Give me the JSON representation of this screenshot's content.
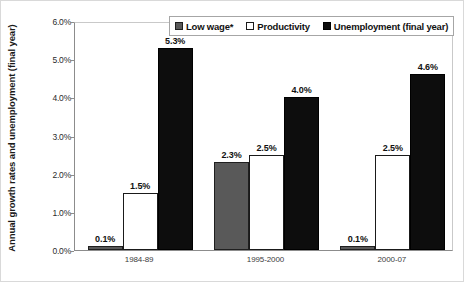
{
  "chart_data": {
    "type": "bar",
    "title": "",
    "xlabel": "",
    "ylabel": "Annual growth rates and unemployment (final year)",
    "ylim": [
      0,
      6
    ],
    "ytick_labels": [
      "6.0%",
      "5.0%",
      "4.0%",
      "3.0%",
      "2.0%",
      "1.0%",
      "0.0%"
    ],
    "ytick_values": [
      6,
      5,
      4,
      3,
      2,
      1,
      0
    ],
    "grid": false,
    "legend_position": "top-right",
    "categories": [
      "1984-89",
      "1995-2000",
      "2000-07"
    ],
    "series": [
      {
        "name": "Low wage*",
        "color": "#595959",
        "values": [
          0.1,
          2.3,
          0.1
        ],
        "labels": [
          "0.1%",
          "2.3%",
          "0.1%"
        ]
      },
      {
        "name": "Productivity",
        "color": "#ffffff",
        "values": [
          1.5,
          2.5,
          2.5
        ],
        "labels": [
          "1.5%",
          "2.5%",
          "2.5%"
        ]
      },
      {
        "name": "Unemployment (final year)",
        "color": "#0d0d0d",
        "values": [
          5.3,
          4.0,
          4.6
        ],
        "labels": [
          "5.3%",
          "4.0%",
          "4.6%"
        ]
      }
    ]
  }
}
